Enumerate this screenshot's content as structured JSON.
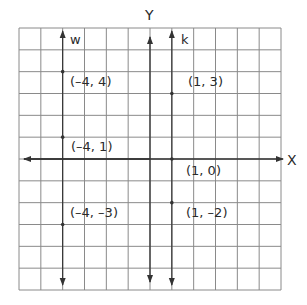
{
  "diagram": {
    "type": "coordinate-grid",
    "grid": {
      "columns": 12,
      "rows": 12,
      "x_range": [
        -6,
        6
      ],
      "y_range": [
        -6,
        6
      ]
    },
    "axes": {
      "x_label": "X",
      "y_label": "Y"
    },
    "lines": [
      {
        "name": "w",
        "equation": "x = -4"
      },
      {
        "name": "k",
        "equation": "x = 1"
      }
    ],
    "points": [
      {
        "label": "(-4, 4)",
        "x": -4,
        "y": 4,
        "line": "w"
      },
      {
        "label": "(-4, 1)",
        "x": -4,
        "y": 1,
        "line": "w"
      },
      {
        "label": "(-4, -3)",
        "x": -4,
        "y": -3,
        "line": "w"
      },
      {
        "label": "(1, 3)",
        "x": 1,
        "y": 3,
        "line": "k"
      },
      {
        "label": "(1, 0)",
        "x": 1,
        "y": 0,
        "line": "k"
      },
      {
        "label": "(1, -2)",
        "x": 1,
        "y": -2,
        "line": "k"
      }
    ],
    "colors": {
      "grid": "#8a8a8a",
      "axis": "#333333",
      "text": "#2a2a2a"
    }
  }
}
